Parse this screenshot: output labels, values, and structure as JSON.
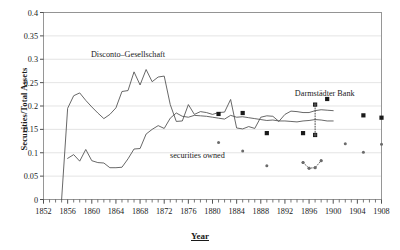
{
  "chart_data": {
    "type": "line",
    "title": "",
    "xlabel": "Year",
    "ylabel": "Securities/Total Assets",
    "xlim": [
      1852,
      1908
    ],
    "ylim": [
      0,
      0.4
    ],
    "grid": true,
    "legend_position": "inline-annotations",
    "xticks": [
      1852,
      1856,
      1860,
      1864,
      1868,
      1872,
      1876,
      1880,
      1884,
      1888,
      1892,
      1896,
      1900,
      1904,
      1908
    ],
    "xtick_labels": [
      "1852",
      "1856",
      "1860",
      "1864",
      "1868",
      "1872",
      "1876",
      "1880",
      "1884",
      "1888",
      "1892",
      "1896",
      "1900",
      "1904",
      "1908"
    ],
    "xtick_minor_step": 1,
    "yticks": [
      0,
      0.05,
      0.1,
      0.15,
      0.2,
      0.25,
      0.3,
      0.35,
      0.4
    ],
    "ytick_labels": [
      "0",
      "0.05",
      "0.1",
      "0.15",
      "0.2",
      "0.25",
      "0.3",
      "0.35",
      "0.4"
    ],
    "annotations": [
      {
        "text": "Disconto–Gesellschaft",
        "x": 1866.0,
        "y": 0.305,
        "name": "disconto-gesellschaft-label"
      },
      {
        "text": "securities owned",
        "x": 1877.5,
        "y": 0.088,
        "name": "securities-owned-label"
      },
      {
        "text": "Darmstädter Bank",
        "x": 1898.6,
        "y": 0.222,
        "name": "darmstadter-bank-label"
      }
    ],
    "series": [
      {
        "name": "Disconto-Gesellschaft",
        "type": "line",
        "color": "#4d4d4d",
        "x": [
          1855,
          1856,
          1857,
          1858,
          1859,
          1860,
          1861,
          1862,
          1863,
          1864,
          1865,
          1866,
          1867,
          1868,
          1869,
          1870,
          1871,
          1872,
          1873,
          1874,
          1875,
          1876,
          1877,
          1878,
          1879,
          1880,
          1881,
          1882,
          1883,
          1884,
          1885,
          1886,
          1887,
          1888,
          1889,
          1890,
          1891,
          1892,
          1893,
          1894,
          1895,
          1896,
          1897,
          1898,
          1899,
          1900
        ],
        "values": [
          0.0,
          0.195,
          0.222,
          0.228,
          0.212,
          0.198,
          0.185,
          0.173,
          0.182,
          0.196,
          0.231,
          0.233,
          0.273,
          0.245,
          0.278,
          0.252,
          0.262,
          0.264,
          0.203,
          0.167,
          0.168,
          0.203,
          0.182,
          0.188,
          0.186,
          0.182,
          0.186,
          0.187,
          0.214,
          0.153,
          0.151,
          0.156,
          0.152,
          0.176,
          0.179,
          0.178,
          0.167,
          0.182,
          0.189,
          0.188,
          0.186,
          0.186,
          0.19,
          0.192,
          0.191,
          0.19
        ]
      },
      {
        "name": "securities owned",
        "type": "line",
        "color": "#4d4d4d",
        "x": [
          1856,
          1857,
          1858,
          1859,
          1860,
          1861,
          1862,
          1863,
          1864,
          1865,
          1866,
          1867,
          1868,
          1869,
          1870,
          1871,
          1872,
          1873,
          1874,
          1875,
          1876,
          1877,
          1878,
          1879,
          1880,
          1881,
          1882,
          1883,
          1884,
          1885,
          1886,
          1887,
          1888,
          1889,
          1890,
          1891,
          1892,
          1893,
          1894,
          1895,
          1896,
          1897,
          1898,
          1899,
          1900
        ],
        "values": [
          0.088,
          0.096,
          0.082,
          0.107,
          0.083,
          0.079,
          0.078,
          0.068,
          0.068,
          0.069,
          0.087,
          0.108,
          0.109,
          0.14,
          0.15,
          0.158,
          0.152,
          0.174,
          0.185,
          0.178,
          0.176,
          0.18,
          0.179,
          0.178,
          0.176,
          0.174,
          0.172,
          0.18,
          0.176,
          0.177,
          0.175,
          0.173,
          0.171,
          0.169,
          0.17,
          0.168,
          0.168,
          0.167,
          0.166,
          0.168,
          0.169,
          0.171,
          0.17,
          0.168,
          0.168
        ]
      },
      {
        "name": "Darmstädter Bank securities ratio (large markers)",
        "type": "scatter",
        "marker": "square",
        "color": "#1a1a1a",
        "x": [
          1881,
          1885,
          1889,
          1895,
          1897,
          1897,
          1899,
          1905
        ],
        "values": [
          0.183,
          0.185,
          0.142,
          0.142,
          0.203,
          0.138,
          0.215,
          0.18
        ]
      },
      {
        "name": "Darmstädter Bank securities owned (small markers)",
        "type": "scatter",
        "marker": "dot",
        "color": "#6b6b6b",
        "x": [
          1881,
          1885,
          1889,
          1895,
          1896,
          1897,
          1898,
          1902,
          1905,
          1908
        ],
        "values": [
          0.122,
          0.104,
          0.072,
          0.079,
          0.067,
          0.068,
          0.083,
          0.119,
          0.101,
          0.118
        ]
      },
      {
        "name": "Darmstädter Bank connector",
        "type": "line",
        "style": "dotted",
        "color": "#4d4d4d",
        "x": [
          1897,
          1897
        ],
        "values": [
          0.138,
          0.203
        ]
      },
      {
        "name": "Darmstädter Bank small-marker connector",
        "type": "line",
        "style": "dotted",
        "color": "#6b6b6b",
        "x": [
          1895,
          1896,
          1897,
          1898
        ],
        "values": [
          0.079,
          0.067,
          0.068,
          0.083
        ]
      },
      {
        "name": "Right edge markers",
        "type": "scatter",
        "marker": "square",
        "color": "#1a1a1a",
        "x": [
          1908
        ],
        "values": [
          0.175
        ]
      }
    ]
  }
}
